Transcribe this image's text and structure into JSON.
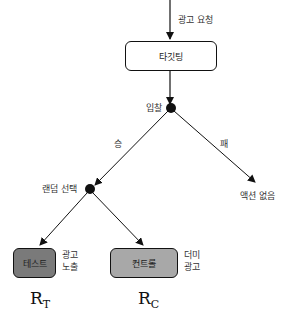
{
  "nodes": {
    "ad_request": "광고 요청",
    "targeting": "타깃팅",
    "bid": "입찰",
    "win": "승",
    "lose": "패",
    "random_select": "랜덤 선택",
    "no_action": "액션 없음",
    "test": "테스트",
    "control": "컨트롤",
    "show_ad_line1": "광고",
    "show_ad_line2": "노출",
    "dummy_ad_line1": "더미",
    "dummy_ad_line2": "광고"
  },
  "math": {
    "rt_base": "R",
    "rt_sub": "T",
    "rc_base": "R",
    "rc_sub": "C"
  },
  "colors": {
    "test_box": "#7a7a7a",
    "control_box": "#a8a8a8",
    "targeting_box": "#ffffff",
    "line": "#111111"
  }
}
